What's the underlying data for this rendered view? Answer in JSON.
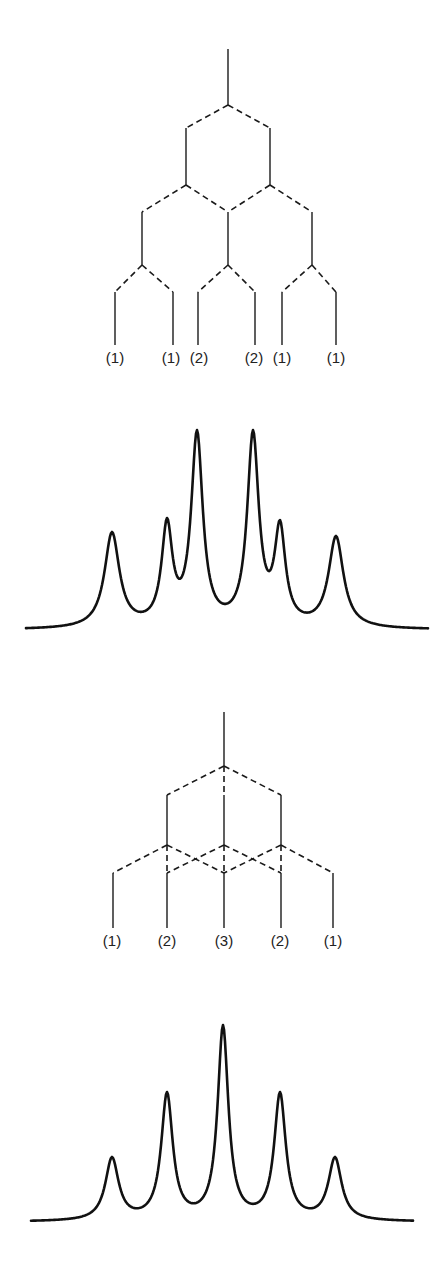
{
  "header": {
    "cropped_text": ""
  },
  "diagrams": [
    {
      "name": "splitting-tree-doublet-of-doublets",
      "levels": [
        {
          "from": [
            0
          ],
          "offsets": [
            -1,
            1
          ],
          "jscale": "J1"
        },
        {
          "from": [
            -1,
            1
          ],
          "offsets": [
            -1,
            1
          ],
          "jscale": "J2"
        },
        {
          "from": [
            -2,
            0,
            2
          ],
          "offsets": [
            -1,
            1
          ],
          "jscale": "J3"
        }
      ],
      "leaf_labels": [
        "(1)",
        "(1)",
        "(2)",
        "(2)",
        "(1)",
        "(1)"
      ]
    },
    {
      "name": "splitting-tree-triplet-like",
      "leaf_labels": [
        "(1)",
        "(2)",
        "(3)",
        "(2)",
        "(1)"
      ]
    }
  ],
  "chart_data": [
    {
      "type": "line",
      "title": "Spectrum 1 (unequal couplings)",
      "xlabel": "",
      "ylabel": "",
      "peaks": [
        {
          "pos": 1,
          "rel_intensity": 1
        },
        {
          "pos": 2,
          "rel_intensity": 1
        },
        {
          "pos": 3,
          "rel_intensity": 2
        },
        {
          "pos": 4,
          "rel_intensity": 2
        },
        {
          "pos": 5,
          "rel_intensity": 1
        },
        {
          "pos": 6,
          "rel_intensity": 1
        }
      ],
      "observed_heights": [
        0.49,
        0.56,
        1.0,
        1.0,
        0.55,
        0.47
      ]
    },
    {
      "type": "line",
      "title": "Spectrum 2 (equal couplings)",
      "xlabel": "",
      "ylabel": "",
      "peaks": [
        {
          "pos": 1,
          "rel_intensity": 1
        },
        {
          "pos": 2,
          "rel_intensity": 2
        },
        {
          "pos": 3,
          "rel_intensity": 3
        },
        {
          "pos": 4,
          "rel_intensity": 2
        },
        {
          "pos": 5,
          "rel_intensity": 1
        }
      ],
      "observed_heights": [
        0.33,
        0.66,
        1.0,
        0.66,
        0.33
      ]
    }
  ]
}
